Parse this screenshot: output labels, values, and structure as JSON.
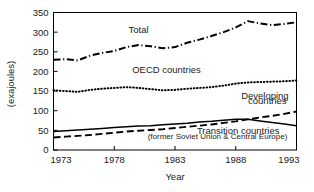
{
  "chart_data": {
    "type": "line",
    "title": "",
    "xlabel": "Year",
    "ylabel": "(exajoules)",
    "xlim": [
      1973,
      1993
    ],
    "ylim": [
      0,
      350
    ],
    "grid": false,
    "legend_position": "inline-annotations",
    "xticks": [
      "1973",
      "1978",
      "1983",
      "1988",
      "1993"
    ],
    "yticks": [
      "0",
      "50",
      "100",
      "150",
      "200",
      "250",
      "300",
      "350"
    ],
    "x": [
      1973,
      1974,
      1975,
      1976,
      1977,
      1978,
      1979,
      1980,
      1981,
      1982,
      1983,
      1984,
      1985,
      1986,
      1987,
      1988,
      1989,
      1990,
      1991,
      1992,
      1993
    ],
    "series": [
      {
        "name": "Total",
        "style": "dash-dot",
        "color": "#000000",
        "values": [
          230,
          231,
          228,
          240,
          247,
          252,
          262,
          267,
          264,
          259,
          262,
          273,
          281,
          290,
          300,
          312,
          328,
          322,
          318,
          321,
          325
        ]
      },
      {
        "name": "OECD countries",
        "style": "dotted",
        "color": "#000000",
        "values": [
          152,
          150,
          148,
          153,
          156,
          158,
          160,
          158,
          155,
          152,
          153,
          156,
          158,
          160,
          164,
          169,
          172,
          173,
          174,
          175,
          177
        ]
      },
      {
        "name": "Developing countries",
        "style": "dashed",
        "color": "#000000",
        "values": [
          32,
          34,
          36,
          38,
          41,
          44,
          47,
          49,
          51,
          53,
          56,
          59,
          62,
          65,
          69,
          73,
          78,
          83,
          87,
          92,
          98
        ]
      },
      {
        "name": "Transition countries",
        "sublabel": "(former Soviet Union & Central Europe)",
        "style": "solid",
        "color": "#000000",
        "values": [
          47,
          49,
          51,
          53,
          55,
          57,
          59,
          61,
          62,
          64,
          66,
          68,
          71,
          73,
          76,
          78,
          78,
          74,
          70,
          66,
          62
        ]
      }
    ],
    "annotations": [
      {
        "id": "total-label",
        "text": "Total",
        "x": 1980.0,
        "y": 297
      },
      {
        "id": "oecd-label",
        "text": "OECD countries",
        "x": 1982.3,
        "y": 196
      },
      {
        "id": "developing-label-line1",
        "text": "Developing",
        "x": 1990.4,
        "y": 131
      },
      {
        "id": "developing-label-line2",
        "text": "countries",
        "x": 1990.6,
        "y": 116
      },
      {
        "id": "transition-label",
        "text": "Transition countries",
        "x": 1988.2,
        "y": 42
      },
      {
        "id": "transition-sublabel",
        "text": "(former Soviet Union & Central Europe)",
        "x": 1986.5,
        "y": 27
      }
    ]
  }
}
